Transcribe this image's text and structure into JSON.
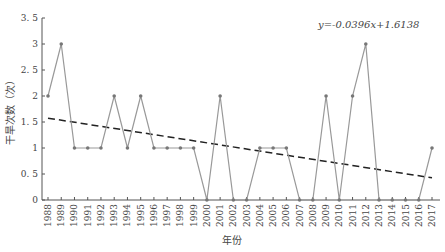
{
  "chart_data": {
    "type": "line",
    "title": "",
    "xlabel": "年份",
    "ylabel": "干旱次数（次）",
    "ylim": [
      0,
      3.5
    ],
    "yticks": [
      "0",
      "0.5",
      "1",
      "1.5",
      "2",
      "2.5",
      "3",
      "3.5"
    ],
    "grid": false,
    "categories": [
      "1988",
      "1989",
      "1990",
      "1991",
      "1992",
      "1993",
      "1994",
      "1995",
      "1996",
      "1997",
      "1998",
      "1999",
      "2000",
      "2001",
      "2002",
      "2003",
      "2004",
      "2005",
      "2006",
      "2007",
      "2008",
      "2009",
      "2010",
      "2011",
      "2012",
      "2013",
      "2014",
      "2015",
      "2016",
      "2017"
    ],
    "series": [
      {
        "name": "干旱次数",
        "style": "solid-with-markers",
        "color": "#999999",
        "values": [
          2,
          3,
          1,
          1,
          1,
          2,
          1,
          2,
          1,
          1,
          1,
          1,
          0,
          2,
          0,
          0,
          1,
          1,
          1,
          0,
          0,
          2,
          0,
          2,
          3,
          0,
          0,
          0,
          0,
          1
        ]
      },
      {
        "name": "线性趋势",
        "style": "dashed",
        "color": "#222222",
        "equation": "y=-0.0396x+1.6138",
        "slope": -0.0396,
        "intercept": 1.6138
      }
    ],
    "annotations": [
      "y=-0.0396x+1.6138"
    ]
  }
}
